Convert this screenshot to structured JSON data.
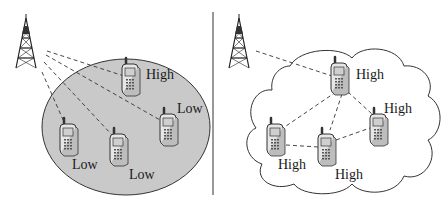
{
  "colors": {
    "ellipse_fill": "#c9c9c9",
    "stroke": "#333333",
    "background": "#ffffff"
  },
  "left_panel": {
    "name": "base-station-centric",
    "tower": {
      "x": 30,
      "y": 16
    },
    "devices": [
      {
        "id": "d1",
        "x": 122,
        "y": 58,
        "label": "High",
        "label_x": 146,
        "label_y": 68
      },
      {
        "id": "d2",
        "x": 158,
        "y": 107,
        "label": "Low",
        "label_x": 176,
        "label_y": 104
      },
      {
        "id": "d3",
        "x": 60,
        "y": 118,
        "label": "Low",
        "label_x": 72,
        "label_y": 158
      },
      {
        "id": "d4",
        "x": 108,
        "y": 128,
        "label": "Low",
        "label_x": 128,
        "label_y": 168
      }
    ]
  },
  "right_panel": {
    "name": "cooperative-cloud",
    "tower": {
      "x": 243,
      "y": 16
    },
    "devices": [
      {
        "id": "r1",
        "x": 330,
        "y": 57,
        "label": "High",
        "label_x": 356,
        "label_y": 68
      },
      {
        "id": "r2",
        "x": 369,
        "y": 108,
        "label": "High",
        "label_x": 384,
        "label_y": 104
      },
      {
        "id": "r3",
        "x": 266,
        "y": 118,
        "label": "High",
        "label_x": 278,
        "label_y": 158
      },
      {
        "id": "r4",
        "x": 316,
        "y": 128,
        "label": "High",
        "label_x": 335,
        "label_y": 168
      }
    ]
  }
}
